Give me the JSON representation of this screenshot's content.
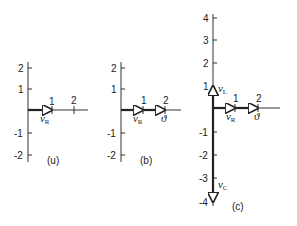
{
  "panels": [
    {
      "id": "a",
      "label": "(u)",
      "y_ticks": [
        "2",
        "1",
        "-1",
        "-2"
      ],
      "x_ticks": [
        "1",
        "2"
      ],
      "phasors": [
        {
          "name": "v",
          "sub": "R",
          "from": [
            0,
            0
          ],
          "to": [
            1,
            0
          ]
        }
      ]
    },
    {
      "id": "b",
      "label": "(b)",
      "y_ticks": [
        "2",
        "1",
        "-1",
        "-2"
      ],
      "x_ticks": [
        "1",
        "2"
      ],
      "phasors": [
        {
          "name": "v",
          "sub": "R",
          "from": [
            0,
            0
          ],
          "to": [
            1,
            0
          ]
        },
        {
          "name": "ϑ",
          "sub": "",
          "from": [
            1,
            0
          ],
          "to": [
            2,
            0
          ]
        }
      ]
    },
    {
      "id": "c",
      "label": "(c)",
      "y_ticks": [
        "4",
        "3",
        "2",
        "1",
        "-1",
        "-2",
        "-3",
        "-4"
      ],
      "x_ticks": [
        "1",
        "2"
      ],
      "phasors": [
        {
          "name": "v",
          "sub": "L",
          "from": [
            0,
            0
          ],
          "to": [
            0,
            1
          ]
        },
        {
          "name": "v",
          "sub": "R",
          "from": [
            0,
            0
          ],
          "to": [
            1,
            0
          ]
        },
        {
          "name": "ϑ",
          "sub": "",
          "from": [
            1,
            0
          ],
          "to": [
            2,
            0
          ]
        },
        {
          "name": "v",
          "sub": "C",
          "from": [
            0,
            0
          ],
          "to": [
            0,
            -4
          ]
        }
      ]
    }
  ],
  "labels": {
    "a_vr": "ᴠ",
    "a_vr_sub": "R",
    "b_vr": "ᴠ",
    "b_vr_sub": "R",
    "b_s": "ϑ",
    "c_vl": "ᴠ",
    "c_vl_sub": "L",
    "c_vr": "ᴠ",
    "c_vr_sub": "R",
    "c_s": "ϑ",
    "c_vc": "ᴠ",
    "c_vc_sub": "C"
  }
}
